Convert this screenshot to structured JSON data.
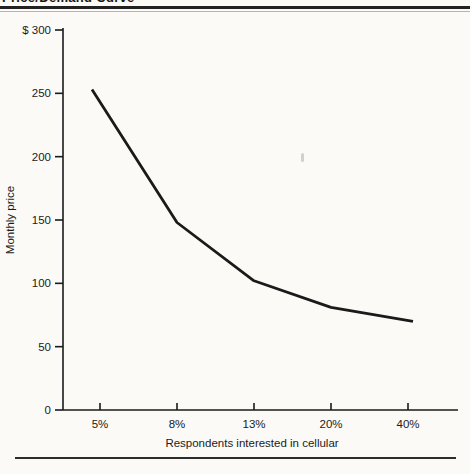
{
  "page": {
    "clipped_title": "Price/Demand Curve",
    "colors": {
      "ink": "#1b1b1b",
      "paper": "#fbfaf7",
      "rule": "#222222"
    }
  },
  "chart_data": {
    "type": "line",
    "title": "Price/Demand Curve",
    "categories": [
      "5%",
      "8%",
      "13%",
      "20%",
      "40%"
    ],
    "values": [
      253,
      148,
      102,
      81,
      70
    ],
    "series": [
      {
        "name": "Monthly price vs. interest level",
        "values": [
          253,
          148,
          102,
          81,
          70
        ]
      }
    ],
    "xlabel": "Respondents interested in cellular",
    "ylabel": "Monthly price",
    "ylim": [
      0,
      300
    ],
    "yticks": [
      0,
      50,
      100,
      150,
      200,
      250,
      300
    ],
    "ytick_labels": [
      "0",
      "50",
      "100",
      "150",
      "200",
      "250",
      "$ 300"
    ],
    "grid": false,
    "legend": "none",
    "currency_prefix_on_top_tick": "$"
  }
}
